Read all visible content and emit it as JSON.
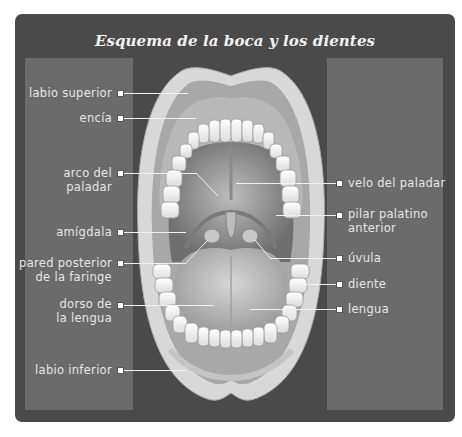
{
  "title": "Esquema de la boca y los dientes",
  "colors": {
    "frame": "#4a4a4a",
    "panel": "#6b6b6b",
    "label_text": "#e6e6e6",
    "leader_line": "#f0f0f0"
  },
  "labels_left": [
    {
      "id": "labio-superior",
      "text": "labio superior"
    },
    {
      "id": "encia",
      "text": "encía"
    },
    {
      "id": "arco-del-paladar",
      "text": "arco del\npaladar"
    },
    {
      "id": "amigdala",
      "text": "amígdala"
    },
    {
      "id": "pared-posterior-faringe",
      "text": "pared posterior\nde la faringe"
    },
    {
      "id": "dorso-lengua",
      "text": "dorso de\nla lengua"
    },
    {
      "id": "labio-inferior",
      "text": "labio inferior"
    }
  ],
  "labels_right": [
    {
      "id": "velo-del-paladar",
      "text": "velo del paladar"
    },
    {
      "id": "pilar-palatino-anterior",
      "text": "pilar palatino\nanterior"
    },
    {
      "id": "uvula",
      "text": "úvula"
    },
    {
      "id": "diente",
      "text": "diente"
    },
    {
      "id": "lengua",
      "text": "lengua"
    }
  ]
}
